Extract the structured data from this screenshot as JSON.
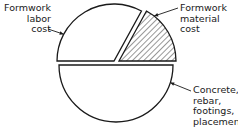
{
  "chart_data": {
    "type": "pie",
    "title": "",
    "exploded": true,
    "slices": [
      {
        "label": "Formwork labor cost",
        "lines": [
          "Formwork",
          "labor",
          "cost"
        ],
        "value": 33,
        "pattern": "none"
      },
      {
        "label": "Formwork material cost",
        "lines": [
          "Formwork",
          "material",
          "cost"
        ],
        "value": 17,
        "pattern": "hatched"
      },
      {
        "label": "Concrete, rebar, footings, placement",
        "lines": [
          "Concrete,",
          "rebar,",
          "footings,",
          "placement"
        ],
        "value": 50,
        "pattern": "none"
      }
    ],
    "colors": {
      "stroke": "#1a1a1a",
      "fill": "#ffffff",
      "hatch": "#1a1a1a"
    }
  }
}
